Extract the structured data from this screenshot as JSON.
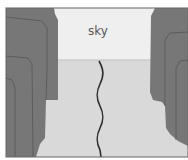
{
  "diagram": {
    "type": "canyon-cross-section",
    "labels": {
      "sky": "sky"
    },
    "colors": {
      "sky": "#efefef",
      "ground": "#d9d9d9",
      "wall": "#777777",
      "wall_outline": "#555555",
      "crack": "#2b2b2b",
      "frame": "#666666"
    }
  }
}
